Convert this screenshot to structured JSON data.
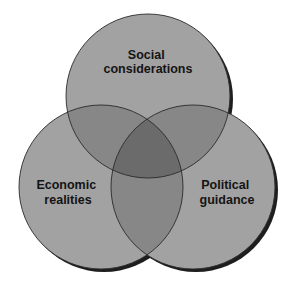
{
  "diagram": {
    "type": "venn",
    "sets": [
      {
        "id": "social",
        "label_lines": [
          "Social",
          "considerations"
        ],
        "center": [
          148,
          96
        ],
        "radius": 82
      },
      {
        "id": "economic",
        "label_lines": [
          "Economic",
          "realities"
        ],
        "center": [
          101,
          187
        ],
        "radius": 82
      },
      {
        "id": "political",
        "label_lines": [
          "Political",
          "guidance"
        ],
        "center": [
          193,
          187
        ],
        "radius": 82
      }
    ],
    "colors": {
      "single_region": "#a2a2a2",
      "pair_overlap": "#878787",
      "triple_overlap": "#6b6b6b",
      "outline": "#2a2a2a",
      "shadow": "#1e1e1e",
      "text": "#141414",
      "background": "#ffffff"
    }
  }
}
